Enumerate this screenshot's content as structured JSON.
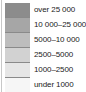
{
  "legend": {
    "items": [
      {
        "label": "over 25 000",
        "color": "#8c8c8c"
      },
      {
        "label": "10 000–25 000",
        "color": "#a6a6a6"
      },
      {
        "label": "5000–10 000",
        "color": "#bdbdbd"
      },
      {
        "label": "2500–5000",
        "color": "#d2d2d2"
      },
      {
        "label": "1000–2500",
        "color": "#e6e6e6"
      },
      {
        "label": "under 1000",
        "color": "#f6f6f6"
      }
    ]
  }
}
